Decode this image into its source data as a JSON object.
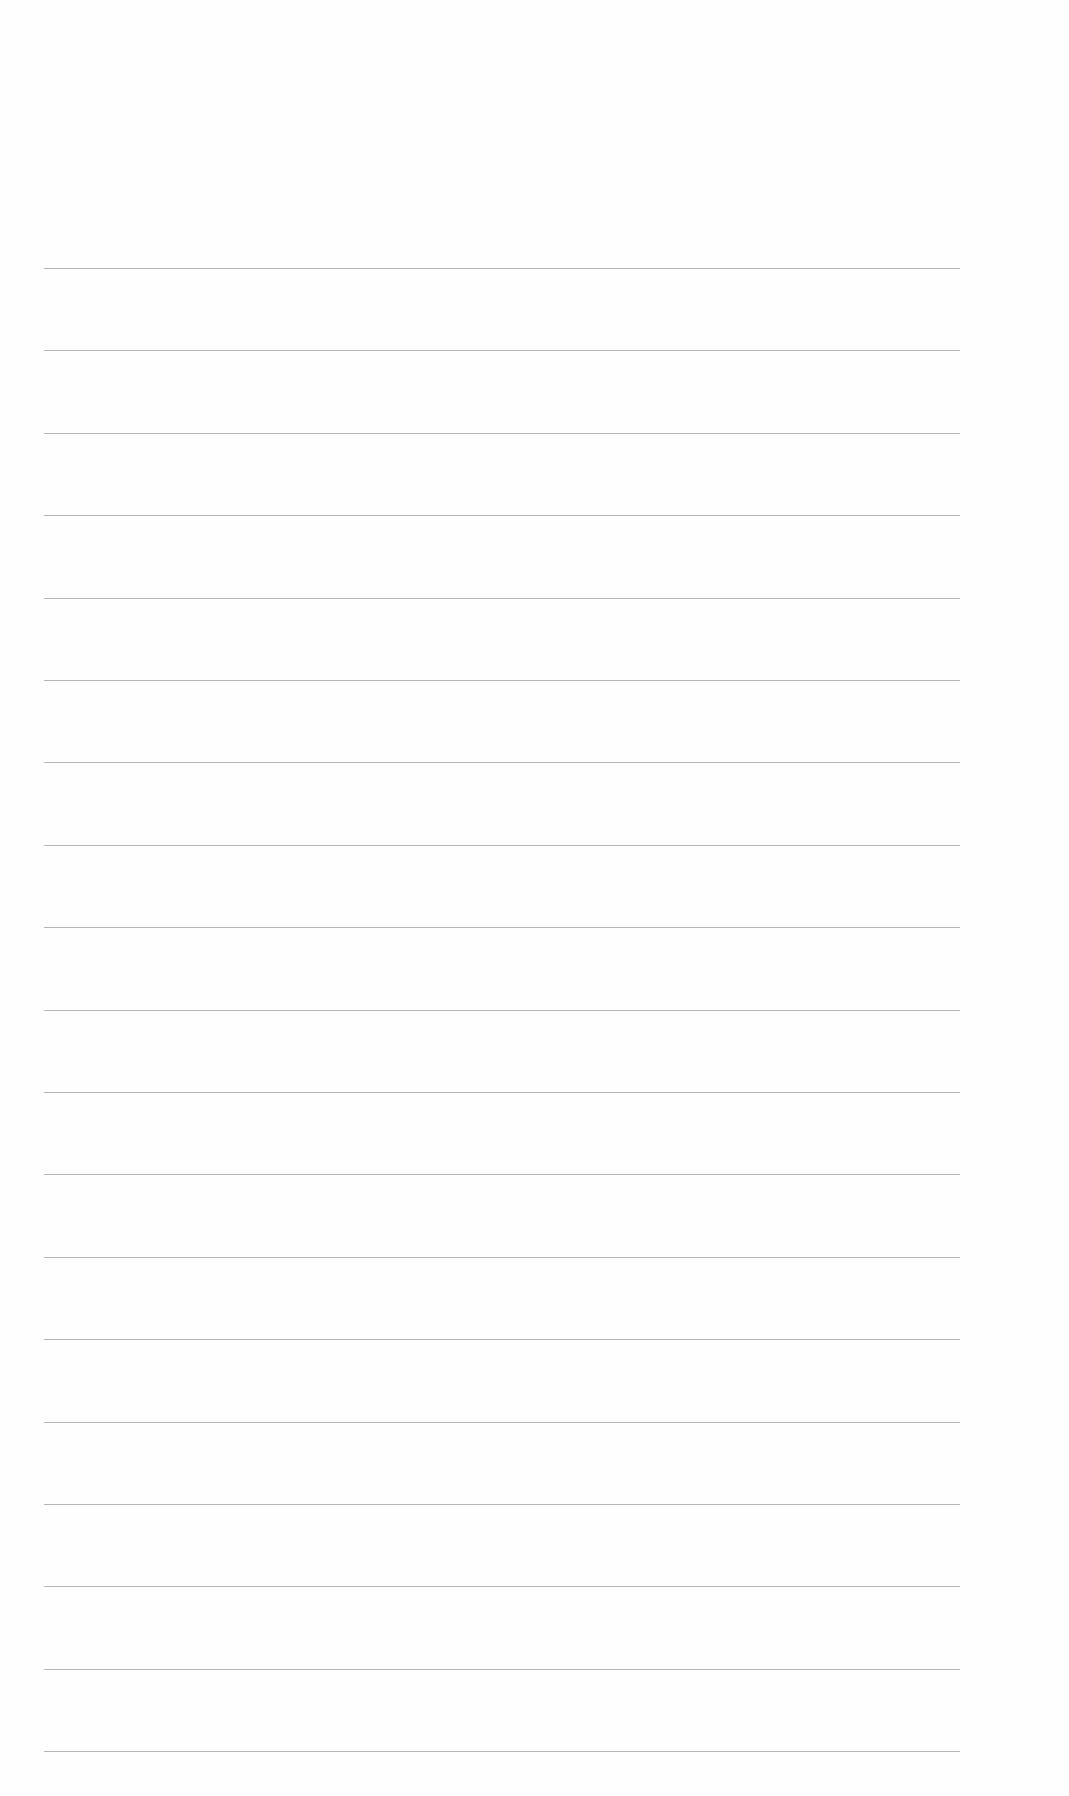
{
  "page": {
    "type": "blank-lined-sheet",
    "background_color": "#fefefe",
    "rule_color": "#a9a9a9",
    "rule_count": 19,
    "rule_left": 44,
    "rule_right": 960,
    "first_rule_y": 268,
    "rule_spacing": 82.4
  }
}
